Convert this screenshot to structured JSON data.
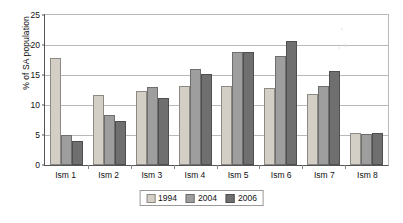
{
  "chart_data": {
    "type": "bar",
    "title": "",
    "xlabel": "",
    "ylabel": "% of SA population",
    "ylim": [
      0,
      25
    ],
    "yticks": [
      0,
      5,
      10,
      15,
      20,
      25
    ],
    "grid": true,
    "legend_position": "bottom-center",
    "categories": [
      "Ism 1",
      "Ism 2",
      "Ism 3",
      "Ism 4",
      "Ism 5",
      "Ism 6",
      "Ism 7",
      "Ism 8"
    ],
    "series": [
      {
        "name": "1994",
        "color": "#d3cfc7",
        "values": [
          17.8,
          11.7,
          12.4,
          13.2,
          13.1,
          12.8,
          11.8,
          5.4
        ]
      },
      {
        "name": "2004",
        "color": "#9e9e9e",
        "values": [
          5.0,
          8.3,
          13.0,
          16.0,
          18.8,
          18.2,
          13.1,
          5.1
        ]
      },
      {
        "name": "2006",
        "color": "#6f6f6f",
        "values": [
          4.0,
          7.4,
          11.2,
          15.2,
          18.8,
          20.6,
          15.7,
          5.3
        ]
      }
    ]
  }
}
